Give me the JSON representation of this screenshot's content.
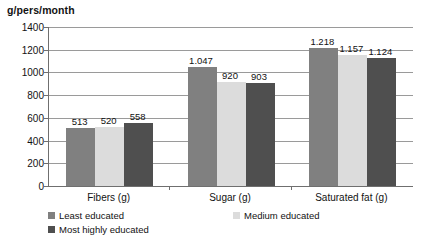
{
  "chart_data": {
    "type": "bar",
    "title": "g/pers/month",
    "xlabel": "",
    "ylabel": "g/pers/month",
    "ylim": [
      0,
      1400
    ],
    "ytick_values": [
      0,
      200,
      400,
      600,
      800,
      1000,
      1200,
      1400
    ],
    "ytick_labels": [
      "0",
      "200",
      "400",
      "600",
      "800",
      "1000",
      "1200",
      "1400"
    ],
    "grid": true,
    "legend_position": "bottom",
    "categories": [
      "Fibers (g)",
      "Sugar (g)",
      "Saturated fat (g)"
    ],
    "series": [
      {
        "name": "Least educated",
        "color": "#808080",
        "values": [
          513,
          1047,
          1218
        ],
        "labels": [
          "513",
          "1.047",
          "1.218"
        ]
      },
      {
        "name": "Medium educated",
        "color": "#dcdcdc",
        "values": [
          520,
          920,
          1157
        ],
        "labels": [
          "520",
          "920",
          "1.157"
        ]
      },
      {
        "name": "Most highly educated",
        "color": "#4f4f4f",
        "values": [
          558,
          903,
          1124
        ],
        "labels": [
          "558",
          "903",
          "1.124"
        ]
      }
    ]
  },
  "legend": {
    "items": [
      {
        "label": "Least educated"
      },
      {
        "label": "Medium educated"
      },
      {
        "label": "Most highly educated"
      }
    ]
  }
}
